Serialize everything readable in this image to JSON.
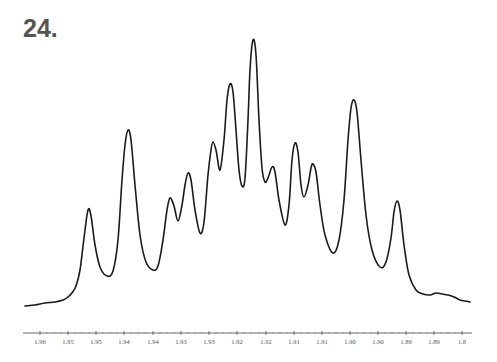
{
  "figure": {
    "label": "24."
  },
  "chart_data": {
    "type": "line",
    "title": "24.",
    "xlabel": "",
    "ylabel": "",
    "x_axis": {
      "reversed": true,
      "tick_labels": [
        "1.96",
        "1.95",
        "1.95",
        "1.94",
        "1.94",
        "1.93",
        "1.93",
        "1.92",
        "1.92",
        "1.91",
        "1.91",
        "1.90",
        "1.90",
        "1.89",
        "1.89",
        "1.8"
      ],
      "tick_pixel_x": [
        40,
        68,
        96,
        124,
        153,
        181,
        209,
        237,
        266,
        294,
        322,
        350,
        378,
        406,
        434,
        462
      ],
      "range_ppm": [
        1.962,
        1.883
      ]
    },
    "grid": false,
    "legend": null,
    "peaks": [
      {
        "ppm": 1.953,
        "rel_intensity": 0.36
      },
      {
        "ppm": 1.946,
        "rel_intensity": 0.65
      },
      {
        "ppm": 1.938,
        "rel_intensity": 0.41
      },
      {
        "ppm": 1.935,
        "rel_intensity": 0.5
      },
      {
        "ppm": 1.931,
        "rel_intensity": 0.61
      },
      {
        "ppm": 1.928,
        "rel_intensity": 0.84
      },
      {
        "ppm": 1.924,
        "rel_intensity": 1.0
      },
      {
        "ppm": 1.921,
        "rel_intensity": 0.51
      },
      {
        "ppm": 1.917,
        "rel_intensity": 0.61
      },
      {
        "ppm": 1.914,
        "rel_intensity": 0.53
      },
      {
        "ppm": 1.907,
        "rel_intensity": 0.77
      },
      {
        "ppm": 1.899,
        "rel_intensity": 0.39
      }
    ],
    "trace_pixels": [
      [
        25,
        306
      ],
      [
        35,
        305
      ],
      [
        45,
        303
      ],
      [
        55,
        302
      ],
      [
        63,
        300
      ],
      [
        68,
        297
      ],
      [
        72,
        293
      ],
      [
        76,
        286
      ],
      [
        80,
        270
      ],
      [
        84,
        238
      ],
      [
        88,
        210
      ],
      [
        91,
        216
      ],
      [
        95,
        245
      ],
      [
        100,
        267
      ],
      [
        107,
        276
      ],
      [
        113,
        271
      ],
      [
        118,
        240
      ],
      [
        122,
        180
      ],
      [
        125,
        145
      ],
      [
        128,
        130
      ],
      [
        131,
        140
      ],
      [
        135,
        185
      ],
      [
        140,
        235
      ],
      [
        146,
        262
      ],
      [
        153,
        270
      ],
      [
        158,
        266
      ],
      [
        163,
        240
      ],
      [
        167,
        210
      ],
      [
        170,
        198
      ],
      [
        174,
        206
      ],
      [
        178,
        221
      ],
      [
        182,
        205
      ],
      [
        185,
        185
      ],
      [
        188,
        173
      ],
      [
        191,
        180
      ],
      [
        195,
        210
      ],
      [
        200,
        233
      ],
      [
        204,
        222
      ],
      [
        208,
        175
      ],
      [
        211,
        150
      ],
      [
        213,
        142
      ],
      [
        216,
        150
      ],
      [
        220,
        170
      ],
      [
        224,
        140
      ],
      [
        227,
        100
      ],
      [
        230,
        84
      ],
      [
        233,
        92
      ],
      [
        236,
        130
      ],
      [
        239,
        170
      ],
      [
        242,
        186
      ],
      [
        245,
        178
      ],
      [
        248,
        120
      ],
      [
        250,
        70
      ],
      [
        253,
        40
      ],
      [
        256,
        55
      ],
      [
        259,
        120
      ],
      [
        262,
        168
      ],
      [
        265,
        182
      ],
      [
        268,
        178
      ],
      [
        272,
        167
      ],
      [
        275,
        172
      ],
      [
        279,
        200
      ],
      [
        285,
        225
      ],
      [
        289,
        205
      ],
      [
        292,
        160
      ],
      [
        295,
        143
      ],
      [
        298,
        152
      ],
      [
        301,
        185
      ],
      [
        304,
        197
      ],
      [
        308,
        185
      ],
      [
        311,
        168
      ],
      [
        313,
        164
      ],
      [
        316,
        172
      ],
      [
        320,
        205
      ],
      [
        325,
        235
      ],
      [
        333,
        253
      ],
      [
        339,
        240
      ],
      [
        344,
        200
      ],
      [
        348,
        140
      ],
      [
        351,
        108
      ],
      [
        354,
        100
      ],
      [
        357,
        112
      ],
      [
        361,
        160
      ],
      [
        366,
        215
      ],
      [
        372,
        250
      ],
      [
        380,
        267
      ],
      [
        386,
        262
      ],
      [
        391,
        238
      ],
      [
        394,
        212
      ],
      [
        397,
        201
      ],
      [
        400,
        210
      ],
      [
        404,
        245
      ],
      [
        409,
        275
      ],
      [
        416,
        290
      ],
      [
        423,
        294
      ],
      [
        430,
        295
      ],
      [
        436,
        293
      ],
      [
        442,
        294
      ],
      [
        448,
        295
      ],
      [
        454,
        297
      ],
      [
        460,
        300
      ],
      [
        465,
        301
      ],
      [
        470,
        302
      ]
    ]
  }
}
